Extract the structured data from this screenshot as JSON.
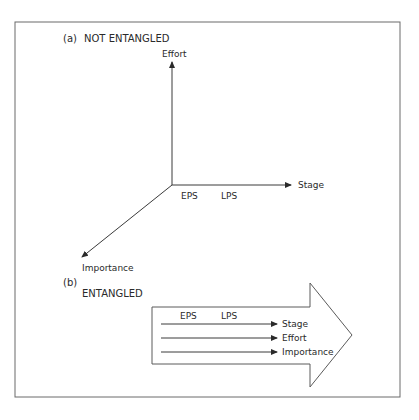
{
  "panel_a": {
    "tag": "(a)",
    "title": "NOT ENTANGLED",
    "axes": {
      "vertical": "Effort",
      "horizontal": "Stage",
      "diagonal": "Importance"
    },
    "stage_marks": [
      "EPS",
      "LPS"
    ]
  },
  "panel_b": {
    "tag": "(b)",
    "title": "ENTANGLED",
    "stage_marks": [
      "EPS",
      "LPS"
    ],
    "lines": [
      "Stage",
      "Effort",
      "Importance"
    ]
  },
  "colors": {
    "line": "#3a3a3a",
    "frame": "#6a6a6a",
    "text": "#2a2a2a"
  }
}
